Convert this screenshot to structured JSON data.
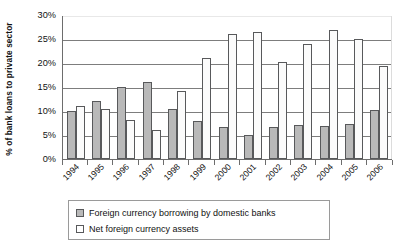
{
  "chart_data": {
    "type": "bar",
    "title": "",
    "xlabel": "",
    "ylabel": "% of bank loans to private sector",
    "ylim": [
      0,
      30
    ],
    "ytick_labels": [
      "30%",
      "25%",
      "20%",
      "15%",
      "10%",
      "5%",
      "0%"
    ],
    "ytick_values": [
      30,
      25,
      20,
      15,
      10,
      5,
      0
    ],
    "grid": true,
    "legend_position": "bottom",
    "categories": [
      "1994",
      "1995",
      "1996",
      "1997",
      "1998",
      "1999",
      "2000",
      "2001",
      "2002",
      "2003",
      "2004",
      "2005",
      "2006"
    ],
    "series": [
      {
        "name": "Foreign currency borrowing by domestic banks",
        "color": "#b9b9b9",
        "values": [
          10.0,
          12.1,
          15.1,
          16.0,
          10.5,
          8.0,
          6.7,
          5.0,
          6.7,
          7.0,
          6.8,
          7.3,
          10.2
        ]
      },
      {
        "name": "Net foreign currency assets",
        "color": "#ffffff",
        "values": [
          11.0,
          10.5,
          8.2,
          6.0,
          14.2,
          21.0,
          26.0,
          26.5,
          20.3,
          24.0,
          26.8,
          25.0,
          19.3
        ]
      }
    ]
  },
  "axis": {
    "y_title": "% of bank loans to private sector"
  },
  "legend": {
    "items": [
      {
        "label": "Foreign currency borrowing by domestic banks",
        "swatch": "filled-gray-swatch"
      },
      {
        "label": "Net foreign currency assets",
        "swatch": "hollow-white-swatch"
      }
    ]
  },
  "bottom_strip": {
    "text": ""
  }
}
